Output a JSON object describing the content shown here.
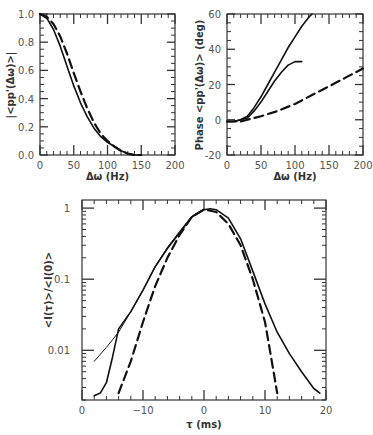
{
  "chart_data": [
    {
      "id": "magnitude",
      "type": "line",
      "title": "",
      "xlabel": "Δω  (Hz)",
      "ylabel": "|<pp'(Δω)>|",
      "xlim": [
        0,
        200
      ],
      "ylim": [
        0.0,
        1.0
      ],
      "xticks": [
        "0",
        "50",
        "100",
        "150",
        "200"
      ],
      "yticks": [
        "0.0",
        "0.2",
        "0.4",
        "0.6",
        "0.8",
        "1.0"
      ],
      "grid": false,
      "series": [
        {
          "name": "solid",
          "style": "solid",
          "x": [
            0,
            10,
            20,
            30,
            40,
            50,
            60,
            70,
            80,
            90,
            100,
            110,
            120,
            130,
            140,
            150
          ],
          "y": [
            1.0,
            0.97,
            0.89,
            0.77,
            0.63,
            0.49,
            0.37,
            0.27,
            0.19,
            0.13,
            0.09,
            0.06,
            0.03,
            0.01,
            0.0,
            0.0
          ]
        },
        {
          "name": "dashed",
          "style": "dashed",
          "x": [
            0,
            10,
            20,
            30,
            40,
            50,
            60,
            70,
            80,
            90,
            100,
            110,
            120,
            130,
            140,
            150
          ],
          "y": [
            1.0,
            0.98,
            0.93,
            0.84,
            0.72,
            0.58,
            0.45,
            0.33,
            0.23,
            0.15,
            0.1,
            0.06,
            0.03,
            0.01,
            0.0,
            0.0
          ]
        }
      ]
    },
    {
      "id": "phase",
      "type": "line",
      "title": "",
      "xlabel": "Δω  (Hz)",
      "ylabel": "Phase <pp'(Δω)> (deg)",
      "xlim": [
        0,
        200
      ],
      "ylim": [
        -20,
        60
      ],
      "xticks": [
        "0",
        "50",
        "100",
        "150",
        "200"
      ],
      "yticks": [
        "-20",
        "0",
        "20",
        "40",
        "60"
      ],
      "grid": false,
      "series": [
        {
          "name": "solid-upper",
          "style": "solid",
          "x": [
            0,
            10,
            20,
            30,
            40,
            50,
            60,
            70,
            80,
            90,
            100,
            110,
            120,
            125
          ],
          "y": [
            -1,
            -1,
            0,
            2,
            7,
            13,
            20,
            27,
            34,
            41,
            47,
            53,
            58,
            60
          ]
        },
        {
          "name": "solid-lower",
          "style": "solid",
          "x": [
            0,
            10,
            20,
            30,
            40,
            50,
            60,
            70,
            80,
            90,
            100,
            110
          ],
          "y": [
            -1,
            -1,
            0,
            1,
            5,
            10,
            16,
            22,
            27,
            31,
            33,
            33
          ]
        },
        {
          "name": "dashed",
          "style": "dashed",
          "x": [
            0,
            10,
            20,
            30,
            40,
            50,
            75,
            100,
            125,
            150,
            175,
            200
          ],
          "y": [
            -1,
            -1,
            -1,
            0,
            1,
            2,
            5,
            9,
            14,
            19,
            24,
            29
          ]
        }
      ]
    },
    {
      "id": "intensity-correlation",
      "type": "line",
      "title": "",
      "xlabel": "τ  (ms)",
      "ylabel": "<I(τ)>/<I(0)>",
      "xscale": "linear",
      "yscale": "log",
      "xlim": [
        -20,
        20
      ],
      "ylim": [
        0.002,
        1.3
      ],
      "xticks": [
        "0",
        "−10",
        "0",
        "10",
        "20"
      ],
      "yticks": [
        "0.01",
        "0.1",
        "1"
      ],
      "grid": false,
      "series": [
        {
          "name": "measured-solid",
          "style": "solid",
          "x": [
            -18,
            -17,
            -16,
            -15,
            -14,
            -12,
            -10,
            -8,
            -6,
            -4,
            -2,
            0,
            1,
            2,
            4,
            6,
            8,
            10,
            12,
            14,
            16,
            18,
            19
          ],
          "y": [
            0.0023,
            0.0025,
            0.0035,
            0.008,
            0.02,
            0.035,
            0.07,
            0.15,
            0.27,
            0.45,
            0.75,
            0.95,
            0.98,
            0.95,
            0.72,
            0.37,
            0.13,
            0.045,
            0.018,
            0.009,
            0.005,
            0.0029,
            0.0025
          ]
        },
        {
          "name": "fit-thin",
          "style": "solid-thin",
          "x": [
            -18,
            -16,
            -14,
            -12,
            -10,
            -8,
            -6,
            -4,
            -2,
            0
          ],
          "y": [
            0.007,
            0.011,
            0.018,
            0.035,
            0.07,
            0.15,
            0.28,
            0.47,
            0.77,
            0.97
          ]
        },
        {
          "name": "gaussian-dashed",
          "style": "dashed",
          "x": [
            -14,
            -12,
            -10,
            -8,
            -6,
            -4,
            -2,
            0,
            2,
            4,
            6,
            8,
            10,
            11,
            12
          ],
          "y": [
            0.0025,
            0.007,
            0.025,
            0.08,
            0.2,
            0.42,
            0.75,
            0.96,
            0.88,
            0.6,
            0.3,
            0.1,
            0.025,
            0.008,
            0.0025
          ]
        }
      ]
    }
  ]
}
